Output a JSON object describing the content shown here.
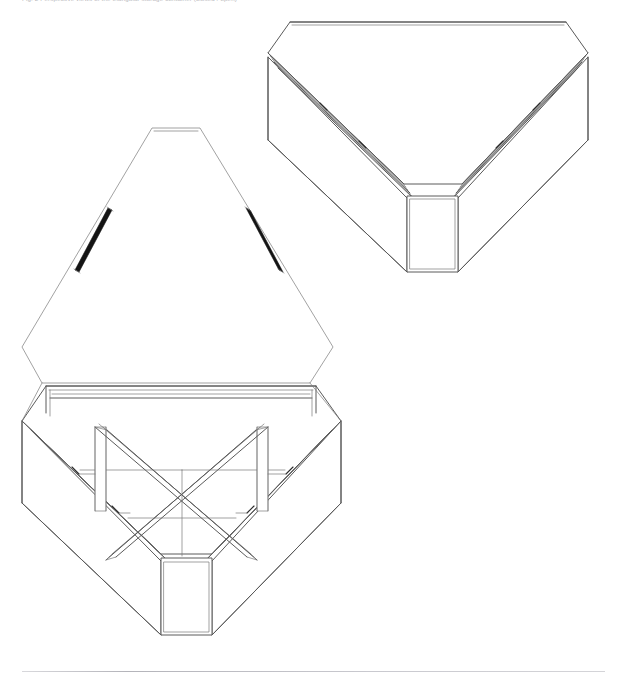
{
  "page": {
    "background_color": "#ffffff",
    "width": 617,
    "height": 685,
    "caption": "Fig. 2  Perspective views of the triangular storage container (closed / open)",
    "line_color": "#555555",
    "accent_line_color": "#1a1a1a"
  },
  "footer": {
    "rule_color": "#c2c2c7"
  },
  "drawing": {
    "title": "Triangular storage container — two perspective views",
    "type": "technical-line-drawing",
    "views": [
      {
        "id": "closed-view",
        "label": "Closed container, lid down",
        "position": "upper-right",
        "parts": [
          "lid-top-panel",
          "lid-edge-band-left",
          "lid-edge-band-right",
          "body-wall-left",
          "body-wall-right",
          "front-corner-panel"
        ]
      },
      {
        "id": "open-view",
        "label": "Open container, lid raised, internal cross dividers visible",
        "position": "lower-left",
        "parts": [
          "lid-panel-open",
          "hinge-strut-left",
          "hinge-strut-right",
          "body-rim",
          "body-wall-left",
          "body-wall-right",
          "front-corner-panel",
          "divider-diagonal-a",
          "divider-diagonal-b",
          "divider-upright-left",
          "divider-upright-right",
          "compartment-floor"
        ]
      }
    ]
  }
}
